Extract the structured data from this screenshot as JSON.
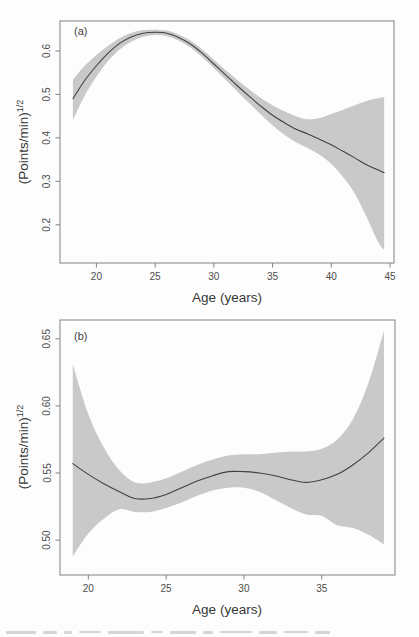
{
  "figure": {
    "background_color": "#fdfdfd",
    "band_color": "#c9c9c9",
    "line_color": "#424242",
    "axis_color": "#818181",
    "text_color": "#4c4c4c"
  },
  "chart_data": [
    {
      "type": "line",
      "panel_label": "(a)",
      "xlabel": "Age (years)",
      "ylabel": "(Points/min)",
      "ylabel_superscript": "1/2",
      "x_ticks": [
        20,
        25,
        30,
        35,
        40,
        45
      ],
      "y_ticks": [
        "0.2",
        "0.3",
        "0.4",
        "0.5",
        "0.6"
      ],
      "xlim": [
        16.9,
        45.34
      ],
      "ylim": [
        0.112,
        0.669
      ],
      "grid": false,
      "legend": null,
      "band_color": "#c9c9c9",
      "line_color": "#424242",
      "x": [
        18,
        19,
        20,
        21,
        22,
        23,
        24,
        25,
        26,
        27,
        28,
        29,
        30,
        31,
        32,
        33,
        34,
        35,
        36,
        37,
        38,
        39,
        40,
        41,
        42,
        43,
        44,
        44.5
      ],
      "series": [
        {
          "name": "fitted",
          "values": [
            0.49,
            0.532,
            0.566,
            0.595,
            0.618,
            0.633,
            0.641,
            0.643,
            0.641,
            0.631,
            0.616,
            0.595,
            0.57,
            0.545,
            0.52,
            0.496,
            0.473,
            0.452,
            0.435,
            0.42,
            0.409,
            0.397,
            0.384,
            0.369,
            0.354,
            0.338,
            0.326,
            0.32
          ]
        },
        {
          "name": "ci_lower",
          "values": [
            0.441,
            0.497,
            0.541,
            0.577,
            0.604,
            0.622,
            0.633,
            0.637,
            0.634,
            0.624,
            0.608,
            0.586,
            0.561,
            0.534,
            0.507,
            0.48,
            0.454,
            0.429,
            0.407,
            0.39,
            0.376,
            0.361,
            0.34,
            0.31,
            0.272,
            0.218,
            0.16,
            0.142
          ]
        },
        {
          "name": "ci_upper",
          "values": [
            0.534,
            0.566,
            0.591,
            0.612,
            0.63,
            0.642,
            0.648,
            0.649,
            0.647,
            0.638,
            0.624,
            0.604,
            0.58,
            0.556,
            0.533,
            0.512,
            0.492,
            0.475,
            0.461,
            0.45,
            0.443,
            0.446,
            0.455,
            0.465,
            0.475,
            0.485,
            0.491,
            0.494
          ]
        }
      ]
    },
    {
      "type": "line",
      "panel_label": "(b)",
      "xlabel": "Age (years)",
      "ylabel": "(Points/min)",
      "ylabel_superscript": "1/2",
      "x_ticks": [
        20,
        25,
        30,
        35
      ],
      "y_ticks": [
        "0.50",
        "0.55",
        "0.60",
        "0.65"
      ],
      "xlim": [
        18.18,
        39.71
      ],
      "ylim": [
        0.474,
        0.664
      ],
      "grid": false,
      "legend": null,
      "band_color": "#c9c9c9",
      "line_color": "#424242",
      "x": [
        19,
        20,
        21,
        22,
        23,
        24,
        25,
        26,
        27,
        28,
        29,
        30,
        31,
        32,
        33,
        34,
        35,
        36,
        37,
        38,
        39
      ],
      "series": [
        {
          "name": "fitted",
          "values": [
            0.557,
            0.549,
            0.542,
            0.536,
            0.531,
            0.531,
            0.534,
            0.539,
            0.544,
            0.548,
            0.551,
            0.551,
            0.55,
            0.548,
            0.545,
            0.543,
            0.545,
            0.549,
            0.556,
            0.565,
            0.576
          ]
        },
        {
          "name": "ci_lower",
          "values": [
            0.488,
            0.505,
            0.516,
            0.523,
            0.521,
            0.521,
            0.524,
            0.528,
            0.533,
            0.537,
            0.539,
            0.539,
            0.536,
            0.53,
            0.524,
            0.519,
            0.518,
            0.511,
            0.509,
            0.504,
            0.497
          ]
        },
        {
          "name": "ci_upper",
          "values": [
            0.631,
            0.594,
            0.569,
            0.552,
            0.543,
            0.543,
            0.546,
            0.551,
            0.556,
            0.56,
            0.563,
            0.564,
            0.564,
            0.565,
            0.566,
            0.566,
            0.568,
            0.575,
            0.59,
            0.617,
            0.656
          ]
        }
      ]
    }
  ]
}
